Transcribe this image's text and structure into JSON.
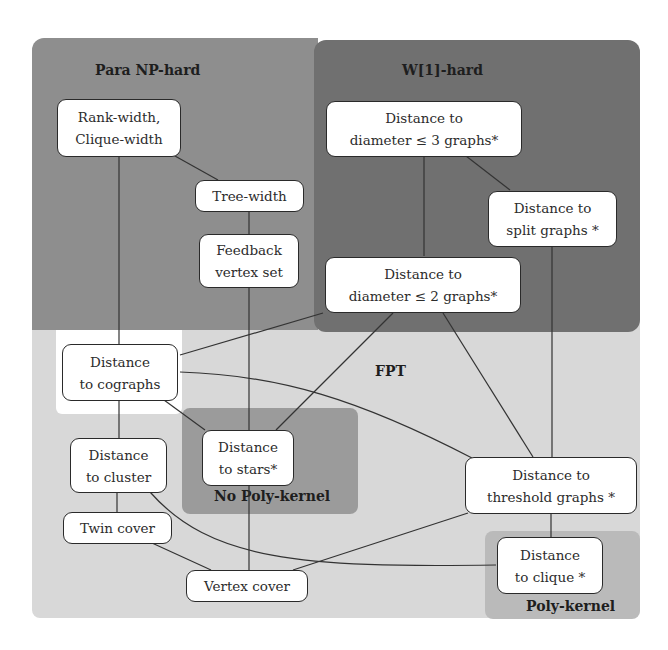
{
  "diagram": {
    "regions": {
      "para_np_hard": {
        "label": "Para NP-hard",
        "color": "#8c8c8c"
      },
      "w1_hard": {
        "label": "W[1]-hard",
        "color": "#6f6f6f"
      },
      "fpt": {
        "label": "FPT",
        "color": "#d6d6d6"
      },
      "no_poly_kernel": {
        "label": "No Poly-kernel",
        "color": "#9a9a9a"
      },
      "poly_kernel": {
        "label": "Poly-kernel",
        "color": "#b9b9b9"
      }
    },
    "nodes": {
      "rank_width": {
        "line1": "Rank-width,",
        "line2": "Clique-width"
      },
      "tree_width": {
        "line1": "Tree-width"
      },
      "feedback_vertex_set": {
        "line1": "Feedback",
        "line2": "vertex set"
      },
      "diam3": {
        "line1": "Distance to",
        "line2": "diameter ≤ 3 graphs*"
      },
      "split": {
        "line1": "Distance to",
        "line2": "split graphs *"
      },
      "diam2": {
        "line1": "Distance to",
        "line2": "diameter ≤ 2 graphs*"
      },
      "cographs": {
        "line1": "Distance",
        "line2": "to cographs"
      },
      "stars": {
        "line1": "Distance",
        "line2": "to stars*"
      },
      "cluster": {
        "line1": "Distance",
        "line2": "to cluster"
      },
      "twin_cover": {
        "line1": "Twin cover"
      },
      "vertex_cover": {
        "line1": "Vertex cover"
      },
      "threshold": {
        "line1": "Distance to",
        "line2": "threshold graphs *"
      },
      "clique": {
        "line1": "Distance",
        "line2": "to clique *"
      }
    },
    "edges": [
      [
        "rank_width",
        "tree_width"
      ],
      [
        "rank_width",
        "cographs"
      ],
      [
        "tree_width",
        "feedback_vertex_set"
      ],
      [
        "feedback_vertex_set",
        "vertex_cover"
      ],
      [
        "diam3",
        "diam2"
      ],
      [
        "diam3",
        "split"
      ],
      [
        "split",
        "threshold"
      ],
      [
        "diam2",
        "cographs"
      ],
      [
        "diam2",
        "stars"
      ],
      [
        "diam2",
        "threshold"
      ],
      [
        "cographs",
        "stars"
      ],
      [
        "cographs",
        "cluster"
      ],
      [
        "cographs",
        "threshold"
      ],
      [
        "cluster",
        "twin_cover"
      ],
      [
        "cluster",
        "clique"
      ],
      [
        "twin_cover",
        "vertex_cover"
      ],
      [
        "threshold",
        "vertex_cover"
      ],
      [
        "threshold",
        "clique"
      ]
    ]
  }
}
